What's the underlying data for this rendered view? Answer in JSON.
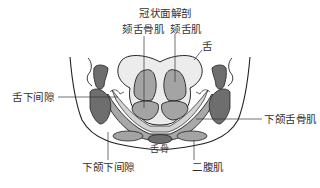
{
  "diagram": {
    "title": "冠状面解剖",
    "labels": {
      "geniohyoid": "颏舌骨肌",
      "genioglossus": "颏舌肌",
      "tongue": "舌",
      "sublingual_space": "舌下间隙",
      "mylohyoid": "下颌舌骨肌",
      "hyoid": "舌骨",
      "submandibular_space": "下颌下间隙",
      "digastric": "二腹肌"
    },
    "colors": {
      "dark_gray": "#6e6e6e",
      "mid_gray": "#a4a4a4",
      "light_gray": "#d4d4d4",
      "very_light": "#ececec",
      "outline": "#222222"
    }
  }
}
